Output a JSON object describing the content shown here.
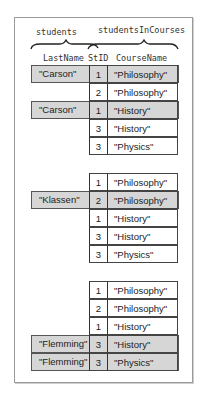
{
  "header": {
    "left_table_label": "students",
    "right_table_label": "studentsInCourses",
    "columns": [
      "LastName",
      "StID",
      "CourseName"
    ]
  },
  "colors": {
    "highlight": "#d6d6d6",
    "border": "#333333",
    "frame": "#9a9a9a"
  },
  "groups": [
    {
      "rows": [
        {
          "last_name": "\"Carson\"",
          "st_id": "1",
          "course": "\"Philosophy\"",
          "match": true
        },
        {
          "last_name": "",
          "st_id": "2",
          "course": "\"Philosophy\"",
          "match": false
        },
        {
          "last_name": "\"Carson\"",
          "st_id": "1",
          "course": "\"History\"",
          "match": true
        },
        {
          "last_name": "",
          "st_id": "3",
          "course": "\"History\"",
          "match": false
        },
        {
          "last_name": "",
          "st_id": "3",
          "course": "\"Physics\"",
          "match": false
        }
      ]
    },
    {
      "rows": [
        {
          "last_name": "",
          "st_id": "1",
          "course": "\"Philosophy\"",
          "match": false
        },
        {
          "last_name": "\"Klassen\"",
          "st_id": "2",
          "course": "\"Philosophy\"",
          "match": true
        },
        {
          "last_name": "",
          "st_id": "1",
          "course": "\"History\"",
          "match": false
        },
        {
          "last_name": "",
          "st_id": "3",
          "course": "\"History\"",
          "match": false
        },
        {
          "last_name": "",
          "st_id": "3",
          "course": "\"Physics\"",
          "match": false
        }
      ]
    },
    {
      "rows": [
        {
          "last_name": "",
          "st_id": "1",
          "course": "\"Philosophy\"",
          "match": false
        },
        {
          "last_name": "",
          "st_id": "2",
          "course": "\"Philosophy\"",
          "match": false
        },
        {
          "last_name": "",
          "st_id": "1",
          "course": "\"History\"",
          "match": false
        },
        {
          "last_name": "\"Flemming\"",
          "st_id": "3",
          "course": "\"History\"",
          "match": true
        },
        {
          "last_name": "\"Flemming\"",
          "st_id": "3",
          "course": "\"Physics\"",
          "match": true
        }
      ]
    }
  ]
}
